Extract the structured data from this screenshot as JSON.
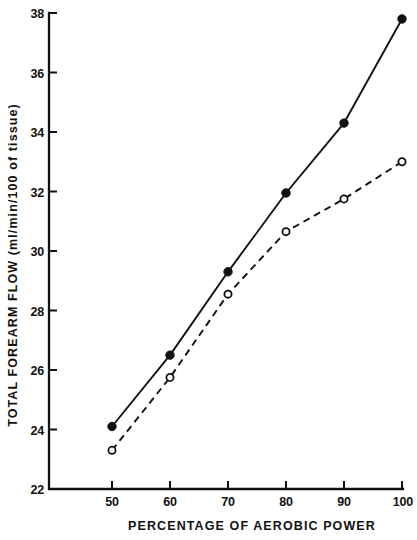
{
  "chart_data": {
    "type": "line",
    "title": "",
    "subtitle": "",
    "xlabel": "PERCENTAGE  OF  AEROBIC  POWER",
    "ylabel": "TOTAL  FOREARM  FLOW  (ml/min/100 of  tissue)",
    "x": [
      50,
      60,
      70,
      80,
      90,
      100
    ],
    "xlim": [
      45,
      103
    ],
    "ylim": [
      22,
      38
    ],
    "xticks": [
      50,
      60,
      70,
      80,
      90,
      100
    ],
    "xtick_labels": [
      "50",
      "60",
      "70",
      "80",
      "90",
      "100"
    ],
    "yticks": [
      22,
      24,
      26,
      28,
      30,
      32,
      34,
      36,
      38
    ],
    "ytick_labels": [
      "22",
      "24",
      "26",
      "28",
      "30",
      "32",
      "34",
      "36",
      "38"
    ],
    "grid": false,
    "legend": "none",
    "series": [
      {
        "name": "filled-circle-solid-line",
        "marker": "filled-circle",
        "linestyle": "solid",
        "color": "#111111",
        "values": [
          24.1,
          26.5,
          29.3,
          31.95,
          34.3,
          37.8
        ]
      },
      {
        "name": "open-circle-dashed-line",
        "marker": "open-circle",
        "linestyle": "dashed",
        "color": "#111111",
        "values": [
          23.3,
          25.75,
          28.55,
          30.65,
          31.75,
          33.0
        ]
      }
    ],
    "annotations": []
  },
  "axes": {
    "y_axis_name": "y-axis",
    "x_axis_name": "x-axis"
  }
}
